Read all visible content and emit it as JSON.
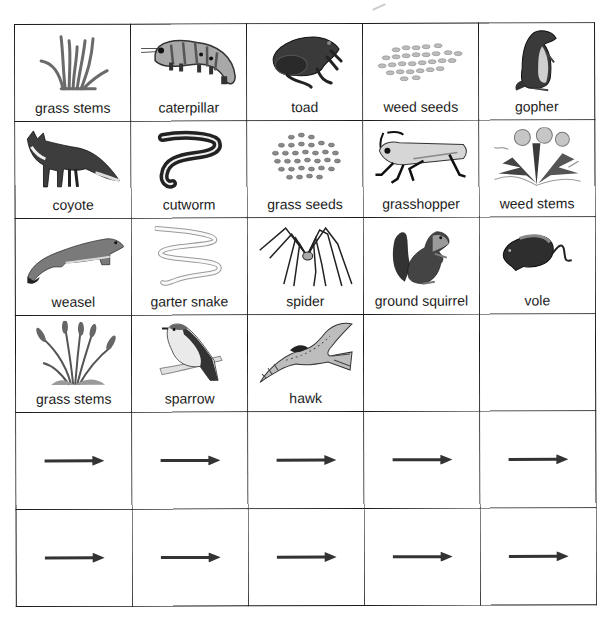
{
  "worksheet": {
    "grid": {
      "columns": 5,
      "rows": 6,
      "organisms": [
        [
          {
            "label": "grass stems",
            "icon": "grass-stems-icon"
          },
          {
            "label": "caterpillar",
            "icon": "caterpillar-icon"
          },
          {
            "label": "toad",
            "icon": "toad-icon"
          },
          {
            "label": "weed seeds",
            "icon": "weed-seeds-icon"
          },
          {
            "label": "gopher",
            "icon": "gopher-icon"
          }
        ],
        [
          {
            "label": "coyote",
            "icon": "coyote-icon"
          },
          {
            "label": "cutworm",
            "icon": "cutworm-icon"
          },
          {
            "label": "grass seeds",
            "icon": "grass-seeds-icon"
          },
          {
            "label": "grasshopper",
            "icon": "grasshopper-icon"
          },
          {
            "label": "weed stems",
            "icon": "weed-stems-icon"
          }
        ],
        [
          {
            "label": "weasel",
            "icon": "weasel-icon"
          },
          {
            "label": "garter snake",
            "icon": "garter-snake-icon"
          },
          {
            "label": "spider",
            "icon": "spider-icon"
          },
          {
            "label": "ground squirrel",
            "icon": "ground-squirrel-icon"
          },
          {
            "label": "vole",
            "icon": "vole-icon"
          }
        ],
        [
          {
            "label": "grass stems",
            "icon": "grass-stems-tall-icon"
          },
          {
            "label": "sparrow",
            "icon": "sparrow-icon"
          },
          {
            "label": "hawk",
            "icon": "hawk-icon"
          },
          {
            "label": "",
            "icon": ""
          },
          {
            "label": "",
            "icon": ""
          }
        ]
      ],
      "arrow_rows": 2,
      "arrow_icon": "arrow-right-icon",
      "colors": {
        "line": "#1a1a1a",
        "arrow": "#333333",
        "text": "#222222",
        "background": "#ffffff"
      }
    }
  }
}
